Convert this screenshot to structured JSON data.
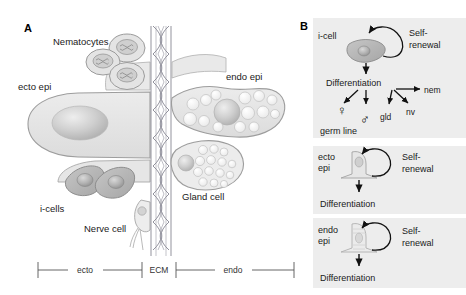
{
  "figure": {
    "background": "#ffffff",
    "panels": [
      {
        "id": "A",
        "label": "A"
      },
      {
        "id": "B",
        "label": "B"
      }
    ]
  },
  "panel_a": {
    "label": "A",
    "annotations": {
      "nematocytes": "Nematocytes",
      "ecto_epi": "ecto epi",
      "i_cells": "i-cells",
      "nerve_cell": "Nerve cell",
      "endo_epi": "endo epi",
      "gland_cell": "Gland cell"
    },
    "scale_bar": {
      "segments": [
        "ecto",
        "ECM",
        "endo"
      ]
    },
    "colors": {
      "cell_fill": "#e2e2e2",
      "cell_stroke": "#9a9a9a",
      "icell_fill": "#b4b4b4",
      "nucleus_fill": "#c3c3c3",
      "ecm_stroke": "#7d7d8a",
      "vacuole_fill": "#f3f3f3"
    },
    "counts": {
      "nematocytes": 3,
      "i_cells": 2
    }
  },
  "panel_b": {
    "label": "B",
    "panel_bg": "#ededed",
    "lineages": [
      {
        "id": "i-cell",
        "cell_label": "i-cell",
        "self_renewal": [
          "Self-",
          "renewal"
        ],
        "differentiation": "Differentiation",
        "derivatives": [
          "nem",
          "nv",
          "gld"
        ],
        "germ_line_label": "germ line",
        "germ_symbols": [
          "♀",
          "♂"
        ]
      },
      {
        "id": "ecto-epi",
        "cell_label": [
          "ecto",
          "epi"
        ],
        "self_renewal": [
          "Self-",
          "renewal"
        ],
        "differentiation": "Differentiation"
      },
      {
        "id": "endo-epi",
        "cell_label": [
          "endo",
          "epi"
        ],
        "self_renewal": [
          "Self-",
          "renewal"
        ],
        "differentiation": "Differentiation"
      }
    ]
  }
}
